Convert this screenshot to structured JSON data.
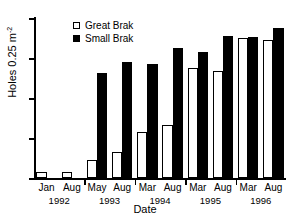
{
  "chart_data": {
    "type": "bar",
    "title": "",
    "xlabel": "Date",
    "ylabel": "Holes 0.25 m",
    "ylabel_exponent": "-2",
    "ylim": [
      0,
      200
    ],
    "yticks": [
      0,
      50,
      100,
      150,
      200
    ],
    "ytick_labels": [
      "0",
      "50",
      "100",
      "150",
      "200"
    ],
    "grid": false,
    "legend_position": "top-left-inside",
    "categories": [
      "Jan",
      "Aug",
      "May",
      "Aug",
      "Mar",
      "Aug",
      "Mar",
      "Aug",
      "Mar",
      "Aug"
    ],
    "year_groups": [
      {
        "year": "1992",
        "months": [
          "Jan",
          "Aug"
        ]
      },
      {
        "year": "1993",
        "months": [
          "May",
          "Aug"
        ]
      },
      {
        "year": "1994",
        "months": [
          "Mar",
          "Aug"
        ]
      },
      {
        "year": "1995",
        "months": [
          "Mar",
          "Aug"
        ]
      },
      {
        "year": "1996",
        "months": [
          "Mar",
          "Aug"
        ]
      }
    ],
    "series": [
      {
        "name": "Great Brak",
        "color": "#ffffff",
        "values": [
          7,
          8,
          22,
          32,
          58,
          66,
          138,
          134,
          175,
          172
        ]
      },
      {
        "name": "Small Brak",
        "color": "#000000",
        "values": [
          0,
          0,
          131,
          145,
          142,
          163,
          158,
          178,
          176,
          188
        ]
      }
    ]
  },
  "legend": {
    "items": [
      {
        "label": "Great Brak",
        "swatch": "white-square"
      },
      {
        "label": "Small Brak",
        "swatch": "black-square"
      }
    ]
  }
}
